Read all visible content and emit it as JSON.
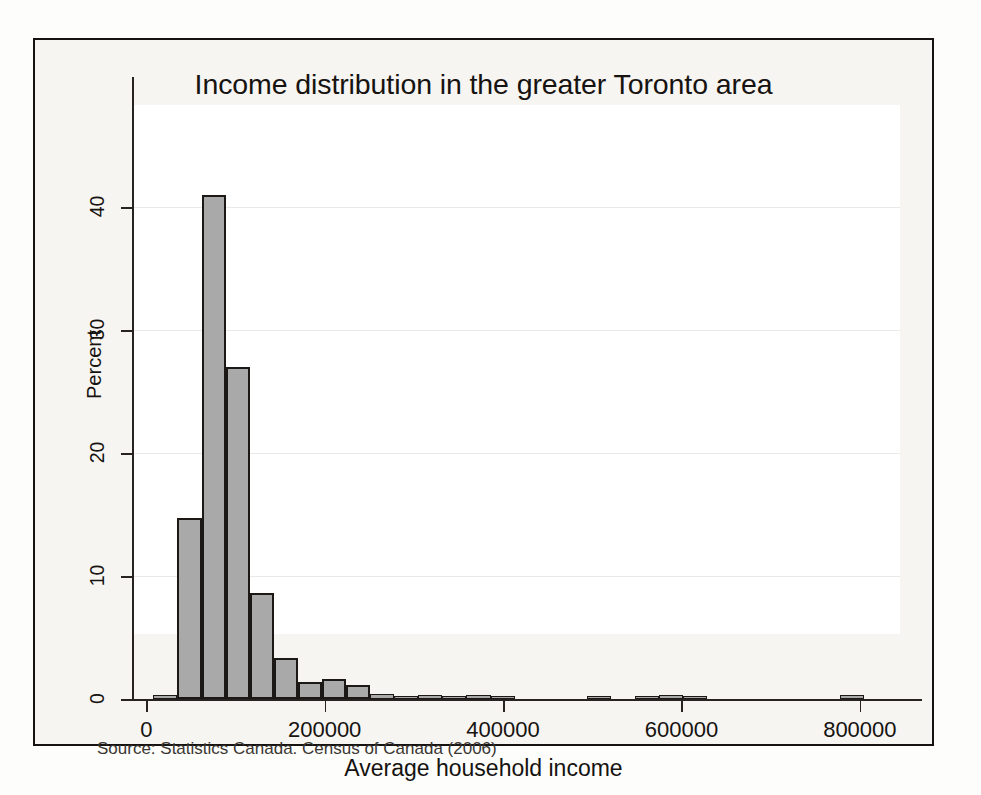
{
  "figure": {
    "title": "Income distribution in the greater Toronto area",
    "note": "Source: Statistics Canada. Census of Canada (2006)",
    "bar_fill": "#a9a9a9",
    "bar_edge": "#1b1815",
    "plot_bg": "#ffffff",
    "frame_color": "#15120f"
  },
  "chart_data": {
    "type": "bar",
    "title": "Income distribution in the greater Toronto area",
    "subtitle": "",
    "xlabel": "Average household income",
    "ylabel": "Percent",
    "xlim": [
      -16000,
      845000
    ],
    "ylim": [
      0,
      43
    ],
    "xticks": [
      0,
      200000,
      400000,
      600000,
      800000
    ],
    "xtick_labels": [
      "0",
      "200000",
      "400000",
      "600000",
      "800000"
    ],
    "yticks": [
      0,
      10,
      20,
      30,
      40
    ],
    "ytick_labels": [
      "0",
      "10",
      "20",
      "30",
      "40"
    ],
    "grid": "horizontal",
    "legend": "none",
    "bin_width": 27000,
    "annotation": "Source: Statistics Canada. Census of Canada (2006)",
    "bins": [
      {
        "x_left": 8000,
        "x_right": 35000,
        "value": 0.3
      },
      {
        "x_left": 35000,
        "x_right": 62000,
        "value": 14.7
      },
      {
        "x_left": 62000,
        "x_right": 89000,
        "value": 41.0
      },
      {
        "x_left": 89000,
        "x_right": 116000,
        "value": 27.0
      },
      {
        "x_left": 116000,
        "x_right": 143000,
        "value": 8.6
      },
      {
        "x_left": 143000,
        "x_right": 170000,
        "value": 3.3
      },
      {
        "x_left": 170000,
        "x_right": 197000,
        "value": 1.4
      },
      {
        "x_left": 197000,
        "x_right": 224000,
        "value": 1.6
      },
      {
        "x_left": 224000,
        "x_right": 251000,
        "value": 1.1
      },
      {
        "x_left": 251000,
        "x_right": 278000,
        "value": 0.4
      },
      {
        "x_left": 278000,
        "x_right": 305000,
        "value": 0.25
      },
      {
        "x_left": 305000,
        "x_right": 332000,
        "value": 0.35
      },
      {
        "x_left": 332000,
        "x_right": 359000,
        "value": 0.2
      },
      {
        "x_left": 359000,
        "x_right": 386000,
        "value": 0.3
      },
      {
        "x_left": 386000,
        "x_right": 413000,
        "value": 0.25
      },
      {
        "x_left": 494000,
        "x_right": 521000,
        "value": 0.25
      },
      {
        "x_left": 548000,
        "x_right": 575000,
        "value": 0.25
      },
      {
        "x_left": 575000,
        "x_right": 602000,
        "value": 0.3
      },
      {
        "x_left": 602000,
        "x_right": 629000,
        "value": 0.2
      },
      {
        "x_left": 778000,
        "x_right": 805000,
        "value": 0.3
      }
    ]
  }
}
